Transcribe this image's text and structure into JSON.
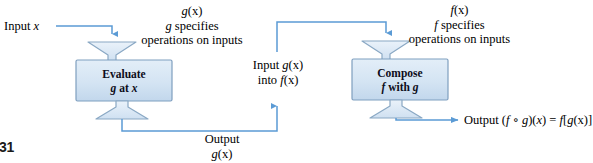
{
  "figure": {
    "page_marker": "31",
    "colors": {
      "line": "#5b9bd5",
      "box_fill_top": "#dbe8f5",
      "box_fill_bottom": "#c5d9ee",
      "box_stroke": "#7f9fbf",
      "funnel_fill": "#dce9f6",
      "funnel_stroke": "#8aa8c4",
      "text": "#000000"
    }
  },
  "labels": {
    "input_x": {
      "word": "Input",
      "var": "x"
    },
    "g_annotation": {
      "line1_fn": "g",
      "line1_arg": "(x)",
      "line2_var": "g",
      "line2_rest": "specifies",
      "line3": "operations on inputs"
    },
    "f_annotation": {
      "line1_fn": "f",
      "line1_arg": "(x)",
      "line2_var": "f",
      "line2_rest": "specifies",
      "line3": "operations on inputs"
    },
    "middle_input": {
      "line1_word": "Input",
      "line1_fn": "g",
      "line1_arg": "(x)",
      "line2_word": "into",
      "line2_fn": "f",
      "line2_arg": "(x)"
    },
    "output_g": {
      "line1": "Output",
      "line2_fn": "g",
      "line2_arg": "(x)"
    },
    "output_final": {
      "word": "Output",
      "expr_open": "(",
      "expr_f": "f",
      "expr_ring": " ∘ ",
      "expr_g": "g",
      "expr_close": ")(",
      "expr_x": "x",
      "expr_eq": ") = ",
      "expr_f2": "f",
      "expr_bracket_open": "[",
      "expr_g2": "g",
      "expr_arg2": "(x)",
      "expr_bracket_close": "]"
    }
  },
  "boxes": [
    {
      "id": "evaluate-box",
      "line1": "Evaluate",
      "line2_var": "g",
      "line2_rest": "at",
      "line2_var2": "x"
    },
    {
      "id": "compose-box",
      "line1": "Compose",
      "line2_var": "f",
      "line2_rest": "with",
      "line2_var2": "g"
    }
  ]
}
